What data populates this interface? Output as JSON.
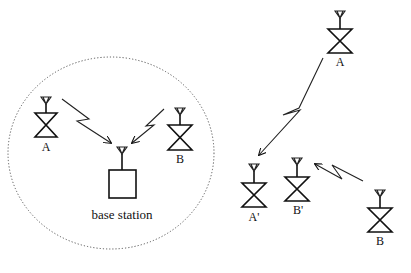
{
  "diagram": {
    "type": "wireless-network-illustration",
    "left_panel": {
      "coverage_area": "dotted circle",
      "nodes": [
        {
          "id": "A",
          "label": "A",
          "kind": "mobile-station"
        },
        {
          "id": "B",
          "label": "B",
          "kind": "mobile-station"
        },
        {
          "id": "BS",
          "label": "base station",
          "kind": "base-station"
        }
      ],
      "links": [
        {
          "from": "A",
          "to": "BS",
          "style": "zigzag-arrow"
        },
        {
          "from": "B",
          "to": "BS",
          "style": "zigzag-arrow"
        }
      ]
    },
    "right_panel": {
      "nodes": [
        {
          "id": "A",
          "label": "A",
          "kind": "mobile-station"
        },
        {
          "id": "A_prime",
          "label": "A'",
          "kind": "mobile-station"
        },
        {
          "id": "B_prime",
          "label": "B'",
          "kind": "mobile-station"
        },
        {
          "id": "B",
          "label": "B",
          "kind": "mobile-station"
        }
      ],
      "links": [
        {
          "from": "A",
          "to": "A'",
          "style": "zigzag-arrow"
        },
        {
          "from": "B",
          "to": "B'",
          "style": "zigzag-arrow"
        }
      ]
    }
  },
  "labels": {
    "left_a": "A",
    "left_b": "B",
    "base_station": "base station",
    "right_a": "A",
    "right_a_prime": "A'",
    "right_b_prime": "B'",
    "right_b": "B"
  },
  "colors": {
    "line": "#111111",
    "circle": "#555555",
    "background": "#ffffff"
  }
}
